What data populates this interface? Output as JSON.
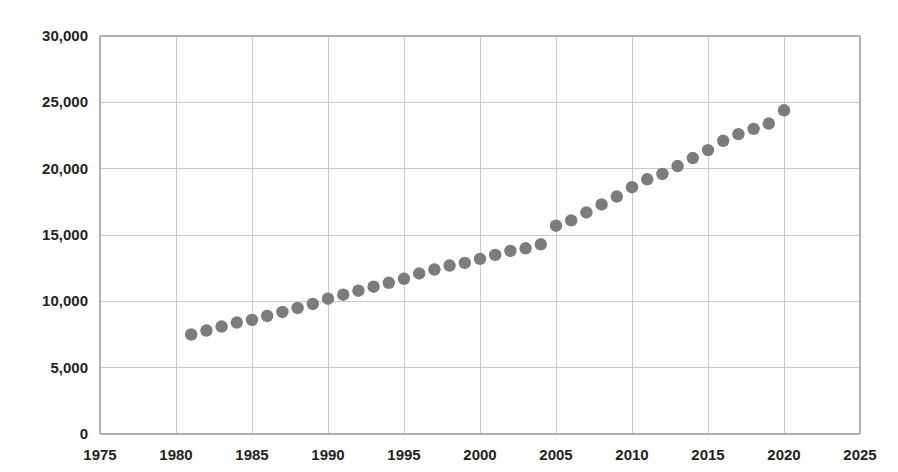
{
  "chart_data": {
    "type": "scatter",
    "title": "",
    "subtitle": "",
    "xlabel": "",
    "ylabel": "",
    "xlim": [
      1975,
      2025
    ],
    "ylim": [
      0,
      30000
    ],
    "grid": true,
    "legend": null,
    "marker_color": "#7c7c7c",
    "marker_shape": "circle",
    "xticks": [
      "1975",
      "1980",
      "1985",
      "1990",
      "1995",
      "2000",
      "2005",
      "2010",
      "2015",
      "2020",
      "2025"
    ],
    "xtick_values": [
      1975,
      1980,
      1985,
      1990,
      1995,
      2000,
      2005,
      2010,
      2015,
      2020,
      2025
    ],
    "yticks": [
      "0",
      "5,000",
      "10,000",
      "15,000",
      "20,000",
      "25,000",
      "30,000"
    ],
    "ytick_values": [
      0,
      5000,
      10000,
      15000,
      20000,
      25000,
      30000
    ],
    "x": [
      1981,
      1982,
      1983,
      1984,
      1985,
      1986,
      1987,
      1988,
      1989,
      1990,
      1991,
      1992,
      1993,
      1994,
      1995,
      1996,
      1997,
      1998,
      1999,
      2000,
      2001,
      2002,
      2003,
      2004,
      2005,
      2006,
      2007,
      2008,
      2009,
      2010,
      2011,
      2012,
      2013,
      2014,
      2015,
      2016,
      2017,
      2018,
      2019,
      2020
    ],
    "values": [
      7500,
      7800,
      8100,
      8400,
      8600,
      8900,
      9200,
      9500,
      9800,
      10200,
      10500,
      10800,
      11100,
      11400,
      11700,
      12100,
      12400,
      12700,
      12900,
      13200,
      13500,
      13800,
      14000,
      14300,
      15700,
      16100,
      16700,
      17300,
      17900,
      18600,
      19200,
      19600,
      20200,
      20800,
      21400,
      22100,
      22600,
      23000,
      23400,
      24400
    ]
  }
}
